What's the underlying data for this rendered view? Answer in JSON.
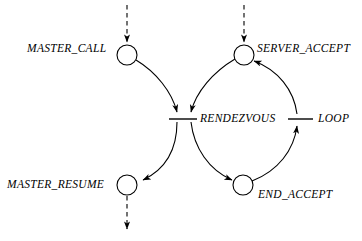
{
  "diagram": {
    "type": "petri-net",
    "style": {
      "stroke": "#000000",
      "background": "#ffffff",
      "label_style": "italic-serif"
    },
    "nodes": [
      {
        "id": "master_call",
        "label": "MASTER_CALL",
        "shape": "circle",
        "cx": 127,
        "cy": 55,
        "r": 10
      },
      {
        "id": "server_accept",
        "label": "SERVER_ACCEPT",
        "shape": "circle",
        "cx": 244,
        "cy": 55,
        "r": 10
      },
      {
        "id": "master_resume",
        "label": "MASTER_RESUME",
        "shape": "circle",
        "cx": 127,
        "cy": 185,
        "r": 10
      },
      {
        "id": "end_accept",
        "label": "END_ACCEPT",
        "shape": "circle",
        "cx": 243,
        "cy": 185,
        "r": 10
      }
    ],
    "transitions": [
      {
        "id": "rendezvous",
        "label": "RENDEZVOUS",
        "shape": "bar",
        "x1": 169,
        "x2": 197,
        "y": 119
      },
      {
        "id": "loop",
        "label": "LOOP",
        "shape": "bar",
        "x1": 288,
        "x2": 313,
        "y": 119
      }
    ],
    "edges": [
      {
        "from": "external",
        "to": "master_call",
        "style": "dashed",
        "arrow": "end"
      },
      {
        "from": "external",
        "to": "server_accept",
        "style": "dashed",
        "arrow": "end"
      },
      {
        "from": "master_call",
        "to": "rendezvous",
        "style": "solid",
        "arrow": "end"
      },
      {
        "from": "server_accept",
        "to": "rendezvous",
        "style": "solid",
        "arrow": "end"
      },
      {
        "from": "rendezvous",
        "to": "master_resume",
        "style": "solid",
        "arrow": "end"
      },
      {
        "from": "rendezvous",
        "to": "end_accept",
        "style": "solid",
        "arrow": "end"
      },
      {
        "from": "end_accept",
        "to": "loop",
        "style": "solid",
        "arrow": "end"
      },
      {
        "from": "loop",
        "to": "server_accept",
        "style": "solid",
        "arrow": "end"
      },
      {
        "from": "master_resume",
        "to": "external",
        "style": "dashed",
        "arrow": "end"
      }
    ]
  },
  "labels": {
    "master_call": "MASTER_CALL",
    "server_accept": "SERVER_ACCEPT",
    "rendezvous": "RENDEZVOUS",
    "loop": "LOOP",
    "master_resume": "MASTER_RESUME",
    "end_accept": "END_ACCEPT"
  }
}
